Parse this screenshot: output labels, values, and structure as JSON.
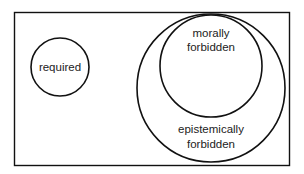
{
  "diagram": {
    "type": "venn",
    "sets": [
      {
        "id": "required",
        "label": [
          "required"
        ]
      },
      {
        "id": "morally-forbidden",
        "label": [
          "morally",
          "forbidden"
        ],
        "subset_of": "epistemically-forbidden"
      },
      {
        "id": "epistemically-forbidden",
        "label": [
          "epistemically",
          "forbidden"
        ]
      }
    ],
    "colors": {
      "stroke": "#111111",
      "background": "#ffffff",
      "text": "#222222"
    }
  }
}
